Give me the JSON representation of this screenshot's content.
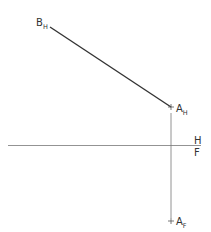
{
  "diagram": {
    "type": "descriptive-geometry-projection",
    "fold_line": {
      "upper_label": "H",
      "lower_label": "F"
    },
    "points": [
      {
        "id": "BH",
        "main": "B",
        "sub": "H",
        "x": 50,
        "y": 27
      },
      {
        "id": "AH",
        "main": "A",
        "sub": "H",
        "x": 171,
        "y": 107
      },
      {
        "id": "AF",
        "main": "A",
        "sub": "F",
        "x": 171,
        "y": 221
      }
    ],
    "colors": {
      "line": "#333333",
      "thin_line": "#777777"
    }
  }
}
